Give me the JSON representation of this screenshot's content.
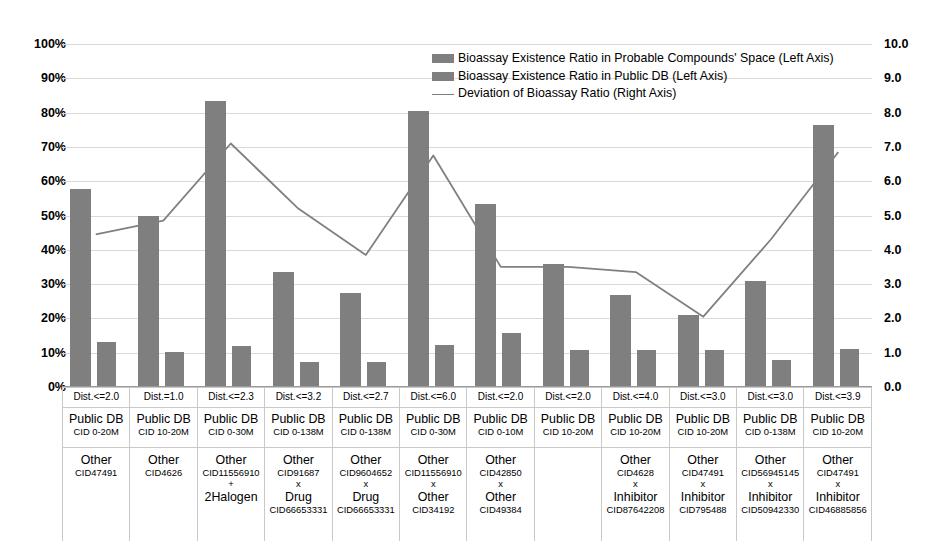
{
  "chart_data": {
    "type": "bar",
    "title": "",
    "xlabel": "",
    "ylabel": "",
    "ylim": [
      0,
      100
    ],
    "y2lim": [
      0,
      10
    ],
    "grid": true,
    "legend_position": "top-center",
    "left_axis_ticks": [
      "0%",
      "10%",
      "20%",
      "30%",
      "40%",
      "50%",
      "60%",
      "70%",
      "80%",
      "90%",
      "100%"
    ],
    "right_axis_ticks": [
      "0.0",
      "1.0",
      "2.0",
      "3.0",
      "4.0",
      "5.0",
      "6.0",
      "7.0",
      "8.0",
      "9.0",
      "10.0"
    ],
    "categories": [
      "Dist.<=2.0",
      "Dist.=1.0",
      "Dist.<=2.3",
      "Dist.<=3.2",
      "Dist.<=2.7",
      "Dist.<=6.0",
      "Dist.<=2.0",
      "Dist.<=2.0",
      "Dist.<=4.0",
      "Dist.<=3.0",
      "Dist.<=3.0",
      "Dist.<=3.9"
    ],
    "series": [
      {
        "name": "Bioassay Existence Ratio in Probable Compounds' Space (Left Axis)",
        "axis": "left",
        "unit": "%",
        "color": "#7f7f7f",
        "values": [
          57.8,
          50.0,
          83.5,
          33.6,
          27.3,
          80.6,
          53.4,
          35.8,
          26.8,
          21.0,
          31.0,
          76.3
        ]
      },
      {
        "name": "Bioassay Existence Ratio in Public DB (Left Axis)",
        "axis": "left",
        "unit": "%",
        "color": "#7f7f7f",
        "values": [
          13.0,
          10.3,
          12.1,
          7.3,
          7.4,
          12.3,
          15.7,
          10.7,
          10.7,
          10.7,
          7.8,
          11.0
        ]
      },
      {
        "name": "Deviation of Bioassay Ratio (Right Axis)",
        "axis": "right",
        "unit": "",
        "color": "#808080",
        "values": [
          4.45,
          4.85,
          7.1,
          5.2,
          3.85,
          6.75,
          3.5,
          3.5,
          3.35,
          2.05,
          4.3,
          6.85
        ]
      }
    ]
  },
  "legend": {
    "items": [
      {
        "label": "Bioassay Existence Ratio in Probable Compounds' Space (Left Axis)",
        "marker": "bar-swatch"
      },
      {
        "label": "Bioassay Existence Ratio in Public DB (Left Axis)",
        "marker": "bar-swatch"
      },
      {
        "label": "Deviation of Bioassay Ratio (Right Axis)",
        "marker": "line-swatch"
      }
    ]
  },
  "x_axis_table": {
    "columns": [
      {
        "dist": "Dist.<=2.0",
        "db_title": "Public DB",
        "db_sub": "CID 0-20M",
        "other_name": "Other",
        "other_cid": "CID47491",
        "operator": "",
        "second_name": "",
        "second_cid": ""
      },
      {
        "dist": "Dist.=1.0",
        "db_title": "Public DB",
        "db_sub": "CID 10-20M",
        "other_name": "Other",
        "other_cid": "CID4626",
        "operator": "",
        "second_name": "",
        "second_cid": ""
      },
      {
        "dist": "Dist.<=2.3",
        "db_title": "Public DB",
        "db_sub": "CID 0-30M",
        "other_name": "Other",
        "other_cid": "CID11556910",
        "operator": "+",
        "second_name": "2Halogen",
        "second_cid": ""
      },
      {
        "dist": "Dist.<=3.2",
        "db_title": "Public DB",
        "db_sub": "CID 0-138M",
        "other_name": "Other",
        "other_cid": "CID91687",
        "operator": "x",
        "second_name": "Drug",
        "second_cid": "CID66653331"
      },
      {
        "dist": "Dist.<=2.7",
        "db_title": "Public DB",
        "db_sub": "CID 0-138M",
        "other_name": "Other",
        "other_cid": "CID9604652",
        "operator": "x",
        "second_name": "Drug",
        "second_cid": "CID66653331"
      },
      {
        "dist": "Dist.<=6.0",
        "db_title": "Public DB",
        "db_sub": "CID 0-30M",
        "other_name": "Other",
        "other_cid": "CID11556910",
        "operator": "x",
        "second_name": "Other",
        "second_cid": "CID34192"
      },
      {
        "dist": "Dist.<=2.0",
        "db_title": "Public DB",
        "db_sub": "CID 0-10M",
        "other_name": "Other",
        "other_cid": "CID42850",
        "operator": "x",
        "second_name": "Other",
        "second_cid": "CID49384"
      },
      {
        "dist": "Dist.<=2.0",
        "db_title": "Public DB",
        "db_sub": "CID 10-20M",
        "other_name": "",
        "other_cid": "",
        "operator": "",
        "second_name": "",
        "second_cid": ""
      },
      {
        "dist": "Dist.<=4.0",
        "db_title": "Public DB",
        "db_sub": "CID 10-20M",
        "other_name": "Other",
        "other_cid": "CID4628",
        "operator": "x",
        "second_name": "Inhibitor",
        "second_cid": "CID87642208"
      },
      {
        "dist": "Dist.<=3.0",
        "db_title": "Public DB",
        "db_sub": "CID 10-20M",
        "other_name": "Other",
        "other_cid": "CID47491",
        "operator": "x",
        "second_name": "Inhibitor",
        "second_cid": "CID795488"
      },
      {
        "dist": "Dist.<=3.0",
        "db_title": "Public DB",
        "db_sub": "CID 0-138M",
        "other_name": "Other",
        "other_cid": "CID56945145",
        "operator": "x",
        "second_name": "Inhibitor",
        "second_cid": "CID50942330"
      },
      {
        "dist": "Dist.<=3.9",
        "db_title": "Public DB",
        "db_sub": "CID 10-20M",
        "other_name": "Other",
        "other_cid": "CID47491",
        "operator": "x",
        "second_name": "Inhibitor",
        "second_cid": "CID46885856"
      }
    ]
  }
}
